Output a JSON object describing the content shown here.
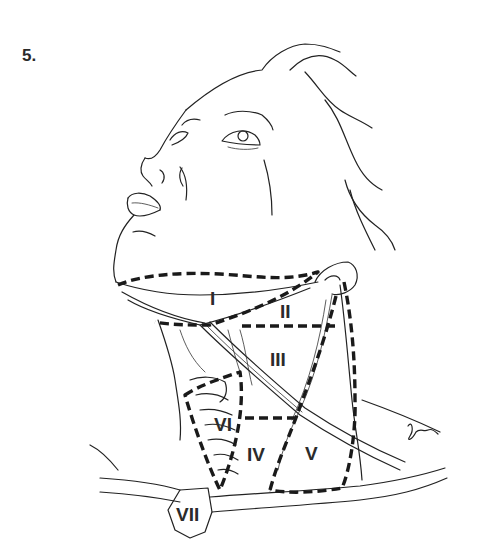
{
  "figure": {
    "number_label": "5.",
    "signature": "signature"
  },
  "levels": [
    {
      "label": "I",
      "x": 210,
      "y": 305
    },
    {
      "label": "II",
      "x": 287,
      "y": 318
    },
    {
      "label": "III",
      "x": 284,
      "y": 366
    },
    {
      "label": "IV",
      "x": 255,
      "y": 461
    },
    {
      "label": "V",
      "x": 312,
      "y": 460
    },
    {
      "label": "VI",
      "x": 224,
      "y": 431
    },
    {
      "label": "VII",
      "x": 193,
      "y": 518
    }
  ],
  "colors": {
    "line": "#222222",
    "dash": "#1a1a1a",
    "background": "#ffffff"
  }
}
